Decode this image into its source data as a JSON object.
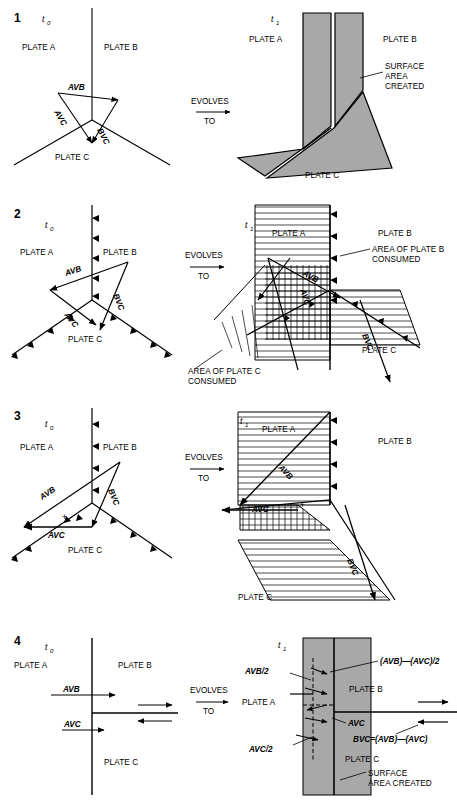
{
  "figure": {
    "evolves_label_line1": "EVOLVES",
    "evolves_label_line2": "TO",
    "time_initial": "t",
    "time_initial_sub": "0",
    "time_final": "t",
    "time_final_sub": "1",
    "plate_a": "PLATE A",
    "plate_b": "PLATE B",
    "plate_c": "PLATE C",
    "vec_avb": "AVB",
    "vec_avc": "AVC",
    "vec_bvc": "BVC",
    "plus_sign": "+",
    "colors": {
      "grey_fill": "#a8a8a8",
      "line": "#000000",
      "background": "#ffffff"
    }
  },
  "panels": [
    {
      "number": "1",
      "left": {
        "time": "t",
        "time_sub": "0",
        "plate_a": "PLATE A",
        "plate_b": "PLATE B",
        "plate_c": "PLATE C",
        "vectors": [
          "AVB",
          "AVC",
          "BVC"
        ],
        "boundary_type": "ridge-ridge-ridge"
      },
      "right": {
        "time": "t",
        "time_sub": "1",
        "plate_a": "PLATE A",
        "plate_b": "PLATE B",
        "plate_c": "PLATE C",
        "annotation_lines": [
          "SURFACE",
          "AREA",
          "CREATED"
        ]
      }
    },
    {
      "number": "2",
      "left": {
        "time": "t",
        "time_sub": "0",
        "plate_a": "PLATE A",
        "plate_b": "PLATE B",
        "plate_c": "PLATE C",
        "vectors": [
          "AVB",
          "AVC",
          "BVC"
        ],
        "boundary_type": "trench-trench-trench"
      },
      "right": {
        "time": "t",
        "time_sub": "1",
        "plate_a": "PLATE A",
        "plate_b": "PLATE B",
        "plate_c": "PLATE C",
        "vectors": [
          "AVB",
          "AVC",
          "BVC"
        ],
        "annotation_b_lines": [
          "AREA OF PLATE B",
          "CONSUMED"
        ],
        "annotation_c_lines": [
          "AREA OF PLATE C",
          "CONSUMED"
        ]
      }
    },
    {
      "number": "3",
      "left": {
        "time": "t",
        "time_sub": "0",
        "plate_a": "PLATE A",
        "plate_b": "PLATE B",
        "plate_c": "PLATE C",
        "vectors": [
          "AVB",
          "AVC",
          "BVC"
        ],
        "plus": "+"
      },
      "right": {
        "time": "t",
        "time_sub": "1",
        "plate_a": "PLATE A",
        "plate_b": "PLATE B",
        "plate_c": "PLATE C",
        "vectors": [
          "AVB",
          "AVC",
          "BVC"
        ],
        "plus": "+"
      }
    },
    {
      "number": "4",
      "left": {
        "time": "t",
        "time_sub": "0",
        "plate_a": "PLATE A",
        "plate_b": "PLATE B",
        "plate_c": "PLATE C",
        "vec_avb": "AVB",
        "vec_avc": "AVC"
      },
      "right": {
        "time": "t",
        "time_sub": "1",
        "plate_a": "PLATE A",
        "plate_b": "PLATE B",
        "plate_c": "PLATE C",
        "label_avb_half": "AVB/2",
        "label_avc_half": "AVC/2",
        "label_avc": "AVC",
        "label_diff_half": "(AVB)—(AVC)/2",
        "label_bvc_eq": "BVC=(AVB)—(AVC)",
        "annotation_lines": [
          "SURFACE",
          "AREA CREATED"
        ]
      }
    }
  ]
}
